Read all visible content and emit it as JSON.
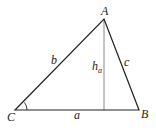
{
  "diagram": {
    "type": "triangle",
    "vertices": {
      "A": {
        "label": "A",
        "x": 104,
        "y": 19
      },
      "B": {
        "label": "B",
        "x": 139,
        "y": 110
      },
      "C": {
        "label": "C",
        "x": 15,
        "y": 110
      }
    },
    "sides": {
      "a": {
        "label": "a"
      },
      "b": {
        "label": "b"
      },
      "c": {
        "label": "c"
      }
    },
    "height": {
      "label": "h",
      "subscript": "a"
    },
    "angle_marker_at": "C",
    "colors": {
      "lines": "#222222",
      "height_line": "#888888"
    }
  }
}
